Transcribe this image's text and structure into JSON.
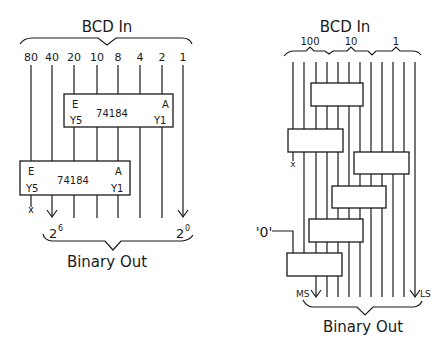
{
  "left": {
    "title": "BCD In",
    "inputs": [
      "80",
      "40",
      "20",
      "10",
      "8",
      "4",
      "2",
      "1"
    ],
    "chips": [
      {
        "part": "74184",
        "enable": "E",
        "a": "A",
        "y5": "Y5",
        "y1": "Y1"
      },
      {
        "part": "74184",
        "enable": "E",
        "a": "A",
        "y5": "Y5",
        "y1": "Y1"
      }
    ],
    "unused_mark": "x",
    "msb_label": "2",
    "msb_exp": "6",
    "lsb_label": "2",
    "lsb_exp": "0",
    "output_title": "Binary Out"
  },
  "right": {
    "title": "BCD In",
    "groups": [
      "100",
      "10",
      "1"
    ],
    "zero_label": "'0'",
    "unused_mark": "x",
    "ms_label": "MS",
    "ls_label": "LS",
    "output_title": "Binary Out"
  }
}
